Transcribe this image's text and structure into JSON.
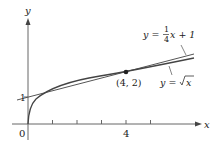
{
  "diagram": {
    "axes": {
      "x_label": "x",
      "y_label": "y",
      "origin_label": "0",
      "x_tick_label": "4",
      "y_tick_label": "1"
    },
    "point": {
      "label": "(4, 2)",
      "x": 4,
      "y": 2
    },
    "tangent_line": {
      "label_lhs": "y = ",
      "frac_num": "1",
      "frac_den": "4",
      "label_rhs": "x + 1"
    },
    "curve": {
      "label_lhs": "y = ",
      "label_rhs": "x"
    },
    "colors": {
      "axis": "#555555",
      "curve": "#444444",
      "line": "#444444"
    }
  }
}
